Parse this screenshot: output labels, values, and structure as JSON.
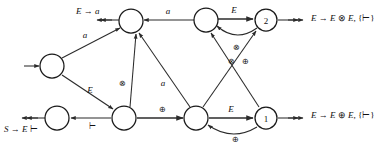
{
  "diagram": {
    "type": "state-transition-graph",
    "colors": {
      "stroke": "#2b2b2b",
      "node_fill": "#ffffff",
      "text": "#111111",
      "background": "#ffffff"
    },
    "states": [
      {
        "id": "start",
        "label": "",
        "cx": 52,
        "cy": 66,
        "r": 12,
        "named": false
      },
      {
        "id": "q_top_left",
        "label": "",
        "cx": 131,
        "cy": 21,
        "r": 12,
        "named": false
      },
      {
        "id": "q_top_mid",
        "label": "",
        "cx": 206,
        "cy": 20,
        "r": 12,
        "named": false
      },
      {
        "id": "q2",
        "label": "2",
        "cx": 266,
        "cy": 20,
        "r": 11,
        "named": true
      },
      {
        "id": "q_bot_left",
        "label": "",
        "cx": 57,
        "cy": 118,
        "r": 12,
        "named": false
      },
      {
        "id": "q_bot_mid",
        "label": "",
        "cx": 124,
        "cy": 118,
        "r": 12,
        "named": false
      },
      {
        "id": "q_bot_right",
        "label": "",
        "cx": 196,
        "cy": 118,
        "r": 12,
        "named": false
      },
      {
        "id": "q1",
        "label": "1",
        "cx": 266,
        "cy": 118,
        "r": 11,
        "named": true
      }
    ],
    "edge_labels": {
      "a_start_topleft": "a",
      "a_topmid_topleft": "a",
      "E_topmid_q2": "E",
      "otimes_q2_topmid": "⊗",
      "otimes_botmid_topleft": "⊗",
      "a_botright_topleft": "a",
      "otimes_q1_topmid": "⊗",
      "oplus_botright_q2": "⊕",
      "E_start_botmid": "E",
      "turnstile_botmid_botleft": "⊢",
      "oplus_botmid_botright": "⊕",
      "E_botright_q1": "E",
      "oplus_q1_botright": "⊕"
    },
    "annotations": [
      {
        "id": "reduce-E-to-a",
        "text_parts": [
          {
            "t": "E",
            "style": "it"
          },
          {
            "t": " → ",
            "style": "ro"
          },
          {
            "t": "a",
            "style": "it"
          }
        ],
        "x": 76,
        "y": 12,
        "anchor": "start"
      },
      {
        "id": "reduce-E-to-E-otimes-E",
        "text_parts": [
          {
            "t": "E",
            "style": "it"
          },
          {
            "t": " → ",
            "style": "ro"
          },
          {
            "t": "E",
            "style": "it"
          },
          {
            "t": " ⊗ ",
            "style": "ro"
          },
          {
            "t": "E",
            "style": "it"
          },
          {
            "t": ", {",
            "style": "ro"
          },
          {
            "t": "⊢",
            "style": "ro"
          },
          {
            "t": "}",
            "style": "ro"
          }
        ],
        "x": 311,
        "y": 19,
        "anchor": "start"
      },
      {
        "id": "reduce-E-to-E-oplus-E",
        "text_parts": [
          {
            "t": "E",
            "style": "it"
          },
          {
            "t": " → ",
            "style": "ro"
          },
          {
            "t": "E",
            "style": "it"
          },
          {
            "t": " ⊕ ",
            "style": "ro"
          },
          {
            "t": "E",
            "style": "it"
          },
          {
            "t": ", {",
            "style": "ro"
          },
          {
            "t": "⊢",
            "style": "ro"
          },
          {
            "t": "}",
            "style": "ro"
          }
        ],
        "x": 311,
        "y": 116,
        "anchor": "start"
      },
      {
        "id": "reduce-S-to-E-turnstile",
        "text_parts": [
          {
            "t": "S",
            "style": "it"
          },
          {
            "t": " → ",
            "style": "ro"
          },
          {
            "t": "E",
            "style": "it"
          },
          {
            "t": " ⊢",
            "style": "ro"
          }
        ],
        "x": 4,
        "y": 130,
        "anchor": "start"
      }
    ]
  }
}
